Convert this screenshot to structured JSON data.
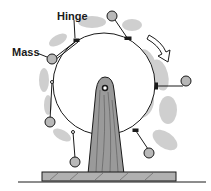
{
  "figure": {
    "labels": {
      "hinge": "Hinge",
      "mass": "Mass"
    },
    "rotation_direction": "clockwise",
    "colors": {
      "ink": "#1a1a1a",
      "shadow": "#a9a9a9",
      "mass_fill": "#b8b8b8",
      "wood": "#9a9a9a",
      "background": "#ffffff"
    }
  }
}
